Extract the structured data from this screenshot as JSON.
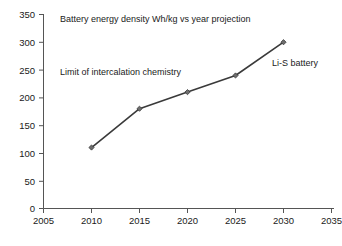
{
  "chart_data": {
    "type": "line",
    "title": "Battery energy density Wh/kg vs year projection",
    "xlabel": "",
    "ylabel": "",
    "x": [
      2010,
      2015,
      2020,
      2025,
      2030
    ],
    "values": [
      110,
      180,
      210,
      240,
      300
    ],
    "series": [
      {
        "name": "Battery energy density",
        "values": [
          110,
          180,
          210,
          240,
          300
        ]
      }
    ],
    "xlim": [
      2005,
      2035
    ],
    "ylim": [
      0,
      350
    ],
    "x_ticks": [
      "2005",
      "2010",
      "2015",
      "2020",
      "2025",
      "2030",
      "2035"
    ],
    "y_ticks": [
      "0",
      "50",
      "100",
      "150",
      "200",
      "250",
      "300",
      "350"
    ],
    "grid": false,
    "legend": "none",
    "marker": "diamond",
    "line_color": "#3a3a3a",
    "marker_color": "#6e6e6e",
    "axis_color": "#555555",
    "annotations": [
      {
        "name": "intercalation-limit-annotation",
        "text": "Limit of intercalation chemistry"
      },
      {
        "name": "li-s-battery-annotation",
        "text": "Li-S battery"
      }
    ]
  }
}
